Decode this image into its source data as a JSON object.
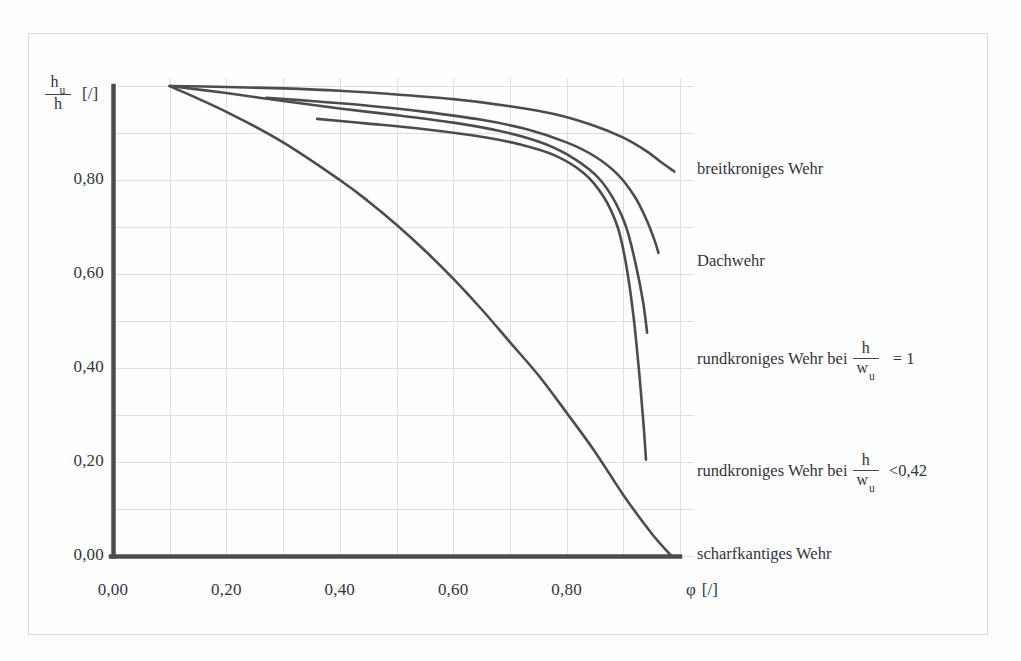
{
  "figure": {
    "background_color": "#fefefe",
    "ink_color": "#4a4c50",
    "grid_color": "#dcdce0",
    "axis_color": "#4a4c50"
  },
  "axes": {
    "y_axis_title_numerator": "h",
    "y_axis_title_numerator_sub": "u",
    "y_axis_title_denominator": "h",
    "y_axis_title_unit": "[/]",
    "x_axis_title_symbol": "φ",
    "x_axis_title_unit": "[/]",
    "y_ticks": [
      "0,80",
      "0,60",
      "0,40",
      "0,20",
      "0,00"
    ],
    "y_tick_values": [
      0.8,
      0.6,
      0.4,
      0.2,
      0.0
    ],
    "x_ticks": [
      "0,00",
      "0,20",
      "0,40",
      "0,60",
      "0,80"
    ],
    "x_tick_values": [
      0.0,
      0.2,
      0.4,
      0.6,
      0.8
    ],
    "xlim": [
      0.0,
      1.0
    ],
    "ylim": [
      0.0,
      1.0
    ],
    "grid": true
  },
  "legend": {
    "entries": [
      {
        "id": "breitkroniges",
        "label": "breitkroniges Wehr",
        "has_fraction": false,
        "value": ""
      },
      {
        "id": "dachwehr",
        "label": "Dachwehr",
        "has_fraction": false,
        "value": ""
      },
      {
        "id": "rundkroniges-1",
        "label": "rundkroniges Wehr bei",
        "has_fraction": true,
        "fraction_num": "h",
        "fraction_den": "w",
        "fraction_den_sub": "u",
        "value": "=  1"
      },
      {
        "id": "rundkroniges-042",
        "label": "rundkroniges Wehr bei",
        "has_fraction": true,
        "fraction_num": "h",
        "fraction_den": "w",
        "fraction_den_sub": "u",
        "value": "<0,42"
      },
      {
        "id": "scharfkantiges",
        "label": "scharfkantiges Wehr",
        "has_fraction": false,
        "value": ""
      }
    ]
  },
  "chart_data": {
    "type": "line",
    "title": "",
    "subtitle": "",
    "xlabel": "φ [/]",
    "ylabel": "h_u / h [/]",
    "xlim": [
      0.0,
      1.0
    ],
    "ylim": [
      0.0,
      1.0
    ],
    "grid": true,
    "legend_position": "right-inline-annotations",
    "series": [
      {
        "name": "breitkroniges Wehr",
        "points": [
          [
            0.1,
            1.0
          ],
          [
            0.2,
            0.998
          ],
          [
            0.3,
            0.995
          ],
          [
            0.4,
            0.99
          ],
          [
            0.5,
            0.982
          ],
          [
            0.6,
            0.972
          ],
          [
            0.7,
            0.957
          ],
          [
            0.78,
            0.94
          ],
          [
            0.85,
            0.915
          ],
          [
            0.9,
            0.89
          ],
          [
            0.94,
            0.862
          ],
          [
            0.97,
            0.835
          ],
          [
            0.99,
            0.818
          ]
        ]
      },
      {
        "name": "Dachwehr",
        "points": [
          [
            0.27,
            0.975
          ],
          [
            0.35,
            0.968
          ],
          [
            0.45,
            0.958
          ],
          [
            0.55,
            0.945
          ],
          [
            0.65,
            0.928
          ],
          [
            0.73,
            0.908
          ],
          [
            0.8,
            0.88
          ],
          [
            0.85,
            0.85
          ],
          [
            0.89,
            0.812
          ],
          [
            0.92,
            0.765
          ],
          [
            0.94,
            0.718
          ],
          [
            0.955,
            0.672
          ],
          [
            0.962,
            0.645
          ]
        ]
      },
      {
        "name": "rundkroniges Wehr bei h/w_u = 1",
        "points": [
          [
            0.1,
            1.0
          ],
          [
            0.2,
            0.985
          ],
          [
            0.3,
            0.968
          ],
          [
            0.4,
            0.952
          ],
          [
            0.5,
            0.938
          ],
          [
            0.6,
            0.922
          ],
          [
            0.68,
            0.905
          ],
          [
            0.75,
            0.882
          ],
          [
            0.8,
            0.855
          ],
          [
            0.85,
            0.812
          ],
          [
            0.88,
            0.765
          ],
          [
            0.905,
            0.7
          ],
          [
            0.922,
            0.62
          ],
          [
            0.935,
            0.54
          ],
          [
            0.942,
            0.475
          ]
        ]
      },
      {
        "name": "rundkroniges Wehr bei h/w_u < 0,42",
        "points": [
          [
            0.36,
            0.93
          ],
          [
            0.45,
            0.92
          ],
          [
            0.55,
            0.908
          ],
          [
            0.65,
            0.892
          ],
          [
            0.72,
            0.875
          ],
          [
            0.78,
            0.852
          ],
          [
            0.83,
            0.815
          ],
          [
            0.865,
            0.765
          ],
          [
            0.89,
            0.7
          ],
          [
            0.905,
            0.62
          ],
          [
            0.918,
            0.51
          ],
          [
            0.928,
            0.39
          ],
          [
            0.936,
            0.275
          ],
          [
            0.94,
            0.205
          ]
        ]
      },
      {
        "name": "scharfkantiges Wehr",
        "points": [
          [
            0.1,
            1.0
          ],
          [
            0.2,
            0.945
          ],
          [
            0.3,
            0.88
          ],
          [
            0.4,
            0.8
          ],
          [
            0.45,
            0.755
          ],
          [
            0.5,
            0.705
          ],
          [
            0.55,
            0.65
          ],
          [
            0.6,
            0.59
          ],
          [
            0.65,
            0.525
          ],
          [
            0.7,
            0.455
          ],
          [
            0.75,
            0.385
          ],
          [
            0.8,
            0.305
          ],
          [
            0.85,
            0.222
          ],
          [
            0.9,
            0.13
          ],
          [
            0.95,
            0.048
          ],
          [
            0.985,
            0.0
          ]
        ]
      }
    ]
  }
}
